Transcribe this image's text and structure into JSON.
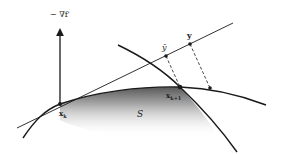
{
  "diagram": {
    "type": "geometric-optimization-sketch",
    "labels": {
      "gradient": "− ∇f′",
      "y_bar": "ȳ",
      "y": "y",
      "x_k": "x",
      "x_k_sub": "k",
      "x_k1": "x",
      "x_k1_sub": "k+1",
      "region": "S"
    },
    "points": {
      "x_k": [
        60,
        104
      ],
      "x_k1": [
        180,
        87
      ],
      "y_bar": [
        166,
        56
      ],
      "y": [
        190,
        44
      ],
      "proj_y": [
        210,
        88
      ]
    },
    "colors": {
      "stroke": "#1a1a1a",
      "shade_dark": "#4a4a4a",
      "shade_light": "#ffffff"
    }
  }
}
